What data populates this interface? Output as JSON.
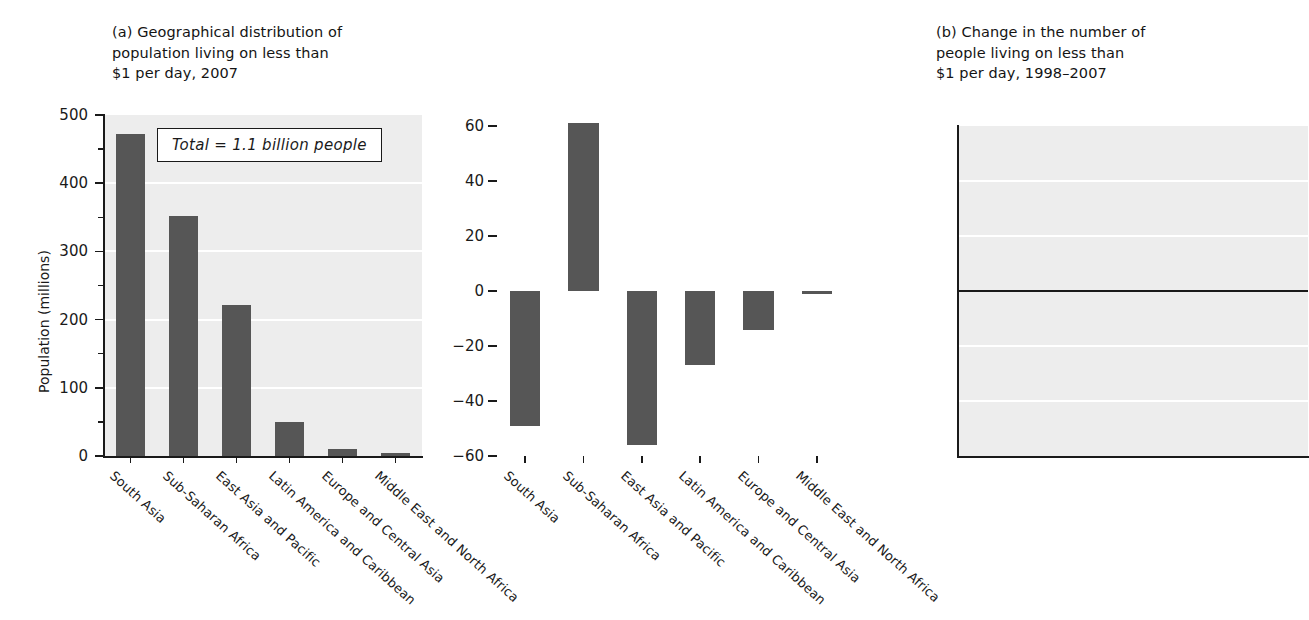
{
  "figure": {
    "background": "#ffffff",
    "bar_color": "#565656",
    "plot_background": "#ededed",
    "gridline_color": "#ffffff",
    "axis_color": "#1a1a1a"
  },
  "panel_a": {
    "title": "(a) Geographical distribution of\n     population living on less than\n     $1 per day, 2007",
    "annotation": "Total = 1.1 billion people",
    "ylabel": "Population (millions)",
    "ytick_labels": [
      "500",
      "400",
      "300",
      "200",
      "100",
      "0"
    ]
  },
  "panel_b": {
    "title": "(b) Change in the number of\n     people living on less than\n     $1 per day, 1998–2007",
    "ytick_labels": [
      "60",
      "40",
      "20",
      "0",
      "−20",
      "−40",
      "−60"
    ]
  },
  "categories": [
    "South Asia",
    "Sub-Saharan Africa",
    "East Asia and Pacific",
    "Latin America and Caribbean",
    "Europe and Central Asia",
    "Middle East and North Africa"
  ],
  "chart_data": [
    {
      "type": "bar",
      "title": "(a) Geographical distribution of population living on less than $1 per day, 2007",
      "xlabel": "",
      "ylabel": "Population (millions)",
      "categories": [
        "South Asia",
        "Sub-Saharan Africa",
        "East Asia and Pacific",
        "Latin America and Caribbean",
        "Europe and Central Asia",
        "Middle East and North Africa"
      ],
      "values": [
        472,
        352,
        222,
        50,
        10,
        4
      ],
      "ylim": [
        0,
        500
      ],
      "yticks": [
        0,
        100,
        200,
        300,
        400,
        500
      ],
      "yticks_minor": [
        50,
        150,
        250,
        350,
        450
      ],
      "grid": true,
      "legend": "none",
      "annotations": [
        "Total = 1.1 billion people"
      ],
      "bar_color": "#565656"
    },
    {
      "type": "bar",
      "title": "(b) Change in the number of people living on less than $1 per day, 1998–2007",
      "xlabel": "",
      "ylabel": "",
      "categories": [
        "South Asia",
        "Sub-Saharan Africa",
        "East Asia and Pacific",
        "Latin America and Caribbean",
        "Europe and Central Asia",
        "Middle East and North Africa"
      ],
      "values": [
        -49,
        61,
        -56,
        -27,
        -14,
        -1
      ],
      "ylim": [
        -60,
        60
      ],
      "yticks": [
        -60,
        -40,
        -20,
        0,
        20,
        40,
        60
      ],
      "grid": true,
      "legend": "none",
      "annotations": [],
      "bar_color": "#565656"
    }
  ]
}
